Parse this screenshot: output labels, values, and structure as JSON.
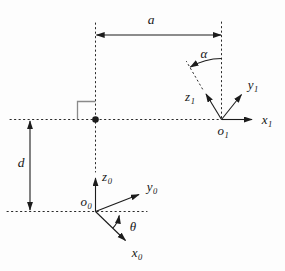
{
  "canvas": {
    "width": 285,
    "height": 271,
    "background": "#fdfdfd",
    "ink": "#1c1c1c",
    "construction_line_color": "#2a2a2a",
    "right_angle_marker_color": "#8a8a8a"
  },
  "dimension_labels": {
    "link_length": "a",
    "link_twist": "α",
    "link_offset": "d",
    "joint_angle": "θ"
  },
  "frame0": {
    "origin_base": "o",
    "origin_sub": "0",
    "x_base": "x",
    "x_sub": "0",
    "y_base": "y",
    "y_sub": "0",
    "z_base": "z",
    "z_sub": "0"
  },
  "frame1": {
    "origin_base": "o",
    "origin_sub": "1",
    "x_base": "x",
    "x_sub": "1",
    "y_base": "y",
    "y_sub": "1",
    "z_base": "z",
    "z_sub": "1"
  }
}
